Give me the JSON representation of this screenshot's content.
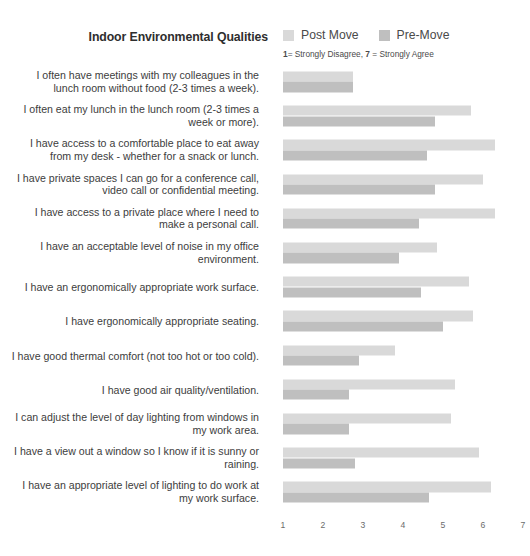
{
  "header": {
    "title": "Indoor Environmental Qualities",
    "scale_note_prefix": "1",
    "scale_note_mid": "= Strongly Disagree, ",
    "scale_note_bold2": "7",
    "scale_note_suffix": " = Strongly Agree"
  },
  "legend": {
    "items": [
      {
        "label": "Post Move",
        "color": "#d9d9d9",
        "name": "legend-swatch-post-move"
      },
      {
        "label": "Pre-Move",
        "color": "#bfbfbf",
        "name": "legend-swatch-pre-move"
      }
    ]
  },
  "chart_data": {
    "type": "bar",
    "orientation": "horizontal",
    "title": "Indoor Environmental Qualities",
    "subtitle": "1= Strongly Disagree, 7 = Strongly Agree",
    "xlabel": "",
    "ylabel": "",
    "xlim": [
      1,
      7
    ],
    "xticks": [
      1,
      2,
      3,
      4,
      5,
      6,
      7
    ],
    "xticklabels": [
      "1",
      "2",
      "3",
      "4",
      "5",
      "6",
      "7"
    ],
    "grid": false,
    "legend_position": "top-right",
    "colors": {
      "post_move": "#d9d9d9",
      "pre_move": "#bfbfbf"
    },
    "categories": [
      "I often have meetings with my colleagues in the lunch room without food (2-3 times a week).",
      "I often eat my lunch in the lunch room (2-3 times a week or more).",
      "I have access to a comfortable place to eat away from my desk - whether for a snack or lunch.",
      "I have private spaces I can go for a conference call, video call or confidential meeting.",
      "I have access to a private place where I need to make a personal call.",
      "I have an acceptable level of noise in my office environment.",
      "I have an ergonomically appropriate work surface.",
      "I have ergonomically appropriate seating.",
      "I have good thermal comfort (not too hot or too cold).",
      "I have good air quality/ventilation.",
      "I can adjust the level of day lighting from windows in my work area.",
      "I have a view out a window so I know if it is sunny or raining.",
      "I have an appropriate level of lighting to do work at my work surface."
    ],
    "series": [
      {
        "name": "Post Move",
        "values": [
          2.75,
          5.7,
          6.3,
          6.0,
          6.3,
          4.85,
          5.65,
          5.75,
          3.8,
          5.3,
          5.2,
          5.9,
          6.2
        ]
      },
      {
        "name": "Pre-Move",
        "values": [
          2.75,
          4.8,
          4.6,
          4.8,
          4.4,
          3.9,
          4.45,
          5.0,
          2.9,
          2.65,
          2.65,
          2.8,
          4.65
        ]
      }
    ]
  }
}
